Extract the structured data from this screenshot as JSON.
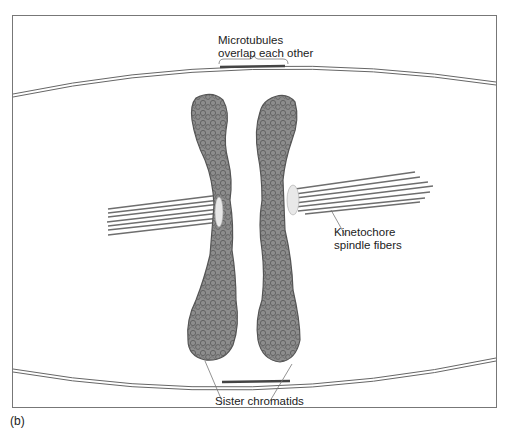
{
  "figure": {
    "panel_label": "(b)",
    "labels": {
      "microtubules_line1": "Microtubules",
      "microtubules_line2": "overlap each other",
      "kinetochore_line1": "Kinetochore",
      "kinetochore_line2": "spindle fibers",
      "sister_chromatids": "Sister chromatids"
    },
    "colors": {
      "chromatid_fill": "#8a8a8a",
      "chromatid_stroke": "#555555",
      "fiber": "#6e6e6e",
      "kinetochore": "#e6e6e6",
      "frame": "#777777"
    }
  }
}
